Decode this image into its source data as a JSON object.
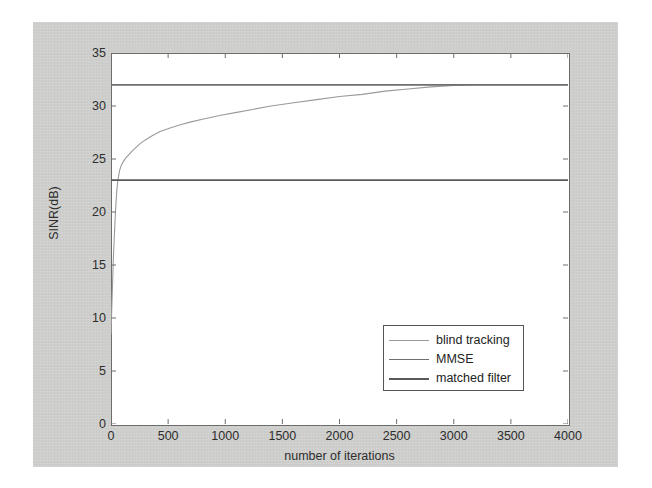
{
  "figure": {
    "background_color": "#cdcdcb",
    "plot_background_color": "#ffffff",
    "axis_color": "#6d6d6d"
  },
  "chart_data": {
    "type": "line",
    "title": "",
    "xlabel": "number of iterations",
    "ylabel": "SINR(dB)",
    "xlim": [
      0,
      4000
    ],
    "ylim": [
      0,
      35
    ],
    "xticks": [
      0,
      500,
      1000,
      1500,
      2000,
      2500,
      3000,
      3500,
      4000
    ],
    "yticks": [
      0,
      5,
      10,
      15,
      20,
      25,
      30,
      35
    ],
    "xtick_labels": [
      "0",
      "500",
      "1000",
      "1500",
      "2000",
      "2500",
      "3000",
      "3500",
      "4000"
    ],
    "ytick_labels": [
      "0",
      "5",
      "10",
      "15",
      "20",
      "25",
      "30",
      "35"
    ],
    "grid": false,
    "legend_position": "lower right",
    "series": [
      {
        "name": "blind tracking",
        "color": "#9a9a9a",
        "linewidth": 1.1,
        "x": [
          0,
          10,
          20,
          30,
          40,
          50,
          60,
          75,
          90,
          110,
          130,
          155,
          180,
          210,
          250,
          300,
          360,
          430,
          510,
          600,
          700,
          820,
          950,
          1100,
          1250,
          1400,
          1600,
          1800,
          2000,
          2200,
          2400,
          2600,
          2800,
          3000,
          3200,
          3400,
          3600,
          3800,
          4000
        ],
        "y": [
          8.5,
          12.0,
          15.4,
          18.0,
          20.2,
          21.9,
          23.0,
          23.9,
          24.4,
          24.8,
          25.1,
          25.4,
          25.7,
          26.0,
          26.4,
          26.8,
          27.2,
          27.6,
          27.9,
          28.2,
          28.5,
          28.8,
          29.1,
          29.4,
          29.7,
          30.0,
          30.3,
          30.6,
          30.9,
          31.1,
          31.4,
          31.6,
          31.8,
          31.95,
          32.0,
          32.0,
          32.0,
          32.0,
          32.0
        ]
      },
      {
        "name": "MMSE",
        "color": "#6f6f6f",
        "linewidth": 1.7,
        "constant_value": 32.0,
        "x": [
          0,
          4000
        ],
        "y": [
          32.0,
          32.0
        ]
      },
      {
        "name": "matched filter",
        "color": "#595959",
        "linewidth": 1.7,
        "constant_value": 23.0,
        "x": [
          0,
          4000
        ],
        "y": [
          23.0,
          23.0
        ]
      }
    ],
    "legend_entries": [
      {
        "label": "blind tracking",
        "color": "#9a9a9a",
        "linewidth": 1.1
      },
      {
        "label": "MMSE",
        "color": "#6f6f6f",
        "linewidth": 1.7
      },
      {
        "label": "matched filter",
        "color": "#595959",
        "linewidth": 2.2
      }
    ]
  }
}
